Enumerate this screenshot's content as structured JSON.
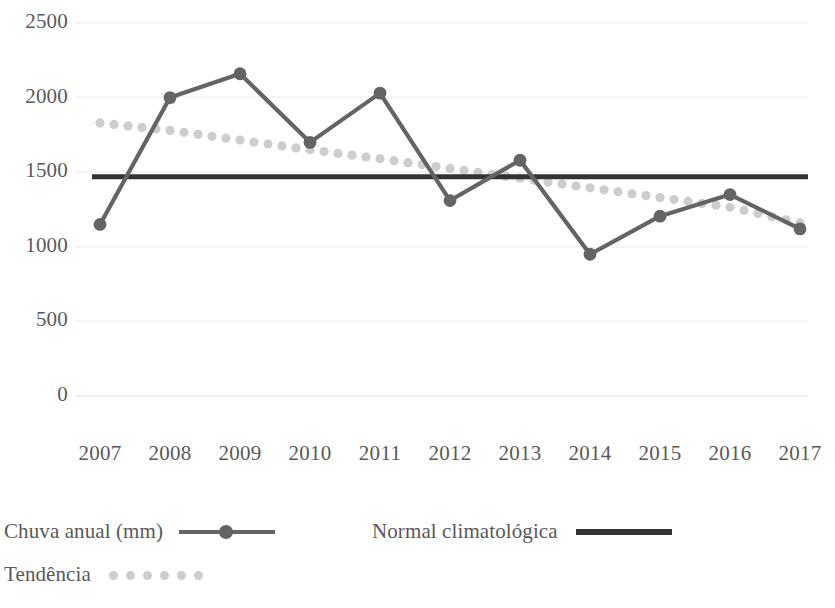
{
  "chart_data": {
    "type": "line",
    "title": "",
    "xlabel": "",
    "ylabel": "",
    "categories": [
      "2007",
      "2008",
      "2009",
      "2010",
      "2011",
      "2012",
      "2013",
      "2014",
      "2015",
      "2016",
      "2017"
    ],
    "ylim": [
      0,
      2500
    ],
    "y_ticks": [
      0,
      500,
      1000,
      1500,
      2000,
      2500
    ],
    "y_tick_labels": [
      "0",
      "500",
      "1000",
      "1500",
      "2000",
      "2500"
    ],
    "grid": true,
    "grid_axis": "y",
    "legend_position": "bottom-left",
    "series": [
      {
        "name": "Chuva anual (mm)",
        "type": "line-markers",
        "color": "#646464",
        "values": [
          1150,
          2000,
          2160,
          1700,
          2030,
          1310,
          1580,
          950,
          1205,
          1350,
          1120
        ]
      },
      {
        "name": "Normal climatológica",
        "type": "horizontal-line",
        "color": "#333333",
        "value": 1470,
        "values": [
          1470,
          1470,
          1470,
          1470,
          1470,
          1470,
          1470,
          1470,
          1470,
          1470,
          1470
        ]
      },
      {
        "name": "Tendência",
        "type": "dotted-trend",
        "color": "#cdcdcd",
        "values": [
          1830,
          1780,
          1715,
          1650,
          1590,
          1525,
          1460,
          1395,
          1330,
          1265,
          1160
        ]
      }
    ]
  },
  "axis": {
    "y_labels": [
      "2500",
      "2000",
      "1500",
      "1000",
      "500",
      "0"
    ],
    "x_labels": [
      "2007",
      "2008",
      "2009",
      "2010",
      "2011",
      "2012",
      "2013",
      "2014",
      "2015",
      "2016",
      "2017"
    ]
  },
  "legend": {
    "items": [
      {
        "label": "Chuva anual (mm)",
        "marker": "line-with-dot-marker",
        "color": "#646464"
      },
      {
        "label": "Normal climatológica",
        "marker": "solid-thick-line",
        "color": "#333333"
      },
      {
        "label": "Tendência",
        "marker": "dotted-line",
        "color": "#cdcdcd"
      }
    ]
  },
  "colors": {
    "series": "#646464",
    "normal": "#333333",
    "trend": "#cdcdcd",
    "gridline": "#e8e8e8",
    "text": "#595959",
    "background": "#ffffff"
  }
}
